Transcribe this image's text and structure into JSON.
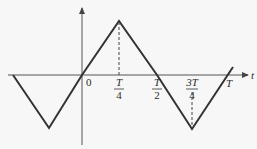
{
  "diagram": {
    "type": "triangle-wave",
    "axis_label_t": "t",
    "origin_label": "0",
    "ticks": [
      {
        "num": "T",
        "den": "4",
        "x": 119
      },
      {
        "num": "T",
        "den": "2",
        "x": 157
      },
      {
        "num": "3T",
        "den": "4",
        "x": 192
      }
    ],
    "period_label": "T",
    "colors": {
      "line": "#333333",
      "axis": "#555555",
      "background": "#f7f7f7"
    }
  }
}
